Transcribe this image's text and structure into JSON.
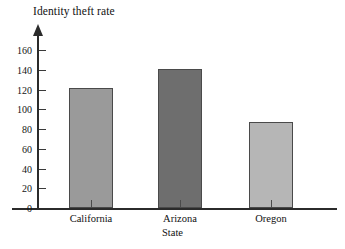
{
  "chart_data": {
    "type": "bar",
    "title": "Identity theft rate",
    "xlabel": "State",
    "ylabel": "",
    "categories": [
      "California",
      "Arizona",
      "Oregon"
    ],
    "values": [
      122,
      141,
      87
    ],
    "ylim": [
      0,
      160
    ],
    "yticks": [
      0,
      20,
      40,
      60,
      80,
      100,
      120,
      140,
      160
    ],
    "ytick_labels": [
      "0",
      "20",
      "40",
      "60",
      "80",
      "100",
      "120",
      "140",
      "160"
    ],
    "grid": false,
    "legend": "none",
    "bar_colors": [
      "#9a9a9a",
      "#6e6e6e",
      "#b6b6b6"
    ],
    "bar_edge_color": "#4a4a4a",
    "axis_color": "#2b2b2b",
    "background": "#ffffff"
  }
}
